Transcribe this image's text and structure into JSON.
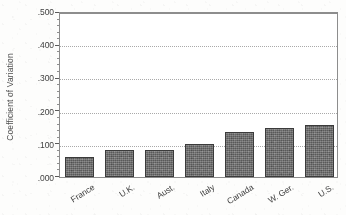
{
  "chart_data": {
    "type": "bar",
    "title": "",
    "subtitle": "",
    "xlabel": "",
    "ylabel": "Coefficient of Variation",
    "categories": [
      "France",
      "U.K.",
      "Aust.",
      "Italy",
      "Canada",
      "W. Ger.",
      "U.S."
    ],
    "values": [
      0.062,
      0.081,
      0.083,
      0.101,
      0.137,
      0.15,
      0.159
    ],
    "series": [
      {
        "name": "Coefficient of Variation",
        "values": [
          0.062,
          0.081,
          0.083,
          0.101,
          0.137,
          0.15,
          0.159
        ]
      }
    ],
    "ylim": [
      0.0,
      0.5
    ],
    "ytick_values": [
      0.0,
      0.1,
      0.2,
      0.3,
      0.4,
      0.5
    ],
    "ytick_labels": [
      ".000",
      ".100",
      ".200",
      ".300",
      ".400",
      ".500"
    ],
    "ytick_minor_step": 0.02,
    "grid": "horizontal-dotted",
    "legend": "none",
    "annotations": [],
    "orientation": "vertical",
    "bar_color": "#6b6b6b",
    "bar_edge_color": "#3b3b3b",
    "gridline_color": "#a9a9a9",
    "axis_color": "#8d8d8d",
    "text_color": "#3f3f3f",
    "background_color": "#ffffff"
  }
}
